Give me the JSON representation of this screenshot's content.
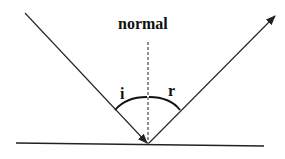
{
  "diagram": {
    "title_label": "normal",
    "incident_angle_label": "i",
    "reflected_angle_label": "r",
    "colors": {
      "line": "#222222",
      "background": "#ffffff"
    }
  }
}
